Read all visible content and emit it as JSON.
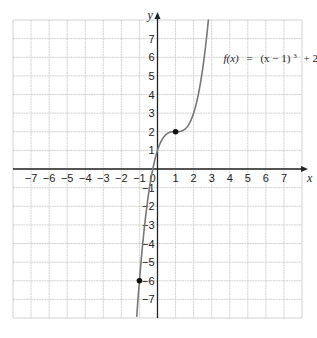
{
  "chart_data": {
    "type": "line",
    "title": "",
    "function_label": "f(x) = (x − 1)³ + 2",
    "function_label_parts": {
      "fx": "f(x)",
      "eq": "=",
      "body": "(x − 1)",
      "exp": "3",
      "tail": "+ 2"
    },
    "xlabel": "x",
    "ylabel": "y",
    "xlim": [
      -8,
      8
    ],
    "ylim": [
      -8,
      8
    ],
    "grid": true,
    "x_ticks": [
      -7,
      -6,
      -5,
      -4,
      -3,
      -2,
      -1,
      0,
      1,
      2,
      3,
      4,
      5,
      6,
      7
    ],
    "y_ticks": [
      7,
      6,
      5,
      4,
      3,
      2,
      1,
      -1,
      -2,
      -3,
      -4,
      -5,
      -6,
      -7
    ],
    "series": [
      {
        "name": "f(x) = (x − 1)³ + 2",
        "x": [
          -1.15,
          -1,
          -0.5,
          0,
          0.5,
          1,
          1.5,
          2,
          2.5,
          3,
          3.05
        ],
        "values": [
          -7.94,
          -6,
          -1.375,
          1,
          1.875,
          2,
          2.125,
          3,
          5.375,
          10,
          10.6
        ]
      }
    ],
    "points": [
      {
        "x": 1,
        "y": 2,
        "label": "(1, 2)"
      },
      {
        "x": -1,
        "y": -6,
        "label": "(−1, −6)"
      }
    ],
    "colors": {
      "curve": "#777777",
      "axis": "#222222",
      "grid": "#c8c8c8",
      "point": "#111111"
    }
  }
}
